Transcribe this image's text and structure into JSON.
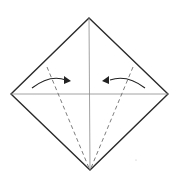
{
  "diagram": {
    "type": "origami-fold-step",
    "description": "Square base in diamond orientation; fold left and right lower edges to the center crease",
    "colors": {
      "outline": "#2a2a2a",
      "crease": "#8a8a8a",
      "fold_line": "#6e6e6e",
      "arrow": "#222222",
      "background": "#ffffff"
    },
    "vertices": {
      "top": [
        89,
        18
      ],
      "left": [
        11,
        94
      ],
      "right": [
        168,
        94
      ],
      "bottom": [
        90,
        170
      ]
    },
    "creases": [
      {
        "name": "vertical-crease",
        "from": [
          89,
          18
        ],
        "to": [
          90,
          170
        ]
      },
      {
        "name": "horizontal-crease",
        "from": [
          11,
          94
        ],
        "to": [
          168,
          94
        ]
      }
    ],
    "valley_fold_lines": [
      {
        "name": "left-valley-fold",
        "from": [
          47,
          67
        ],
        "to": [
          89,
          168
        ]
      },
      {
        "name": "right-valley-fold",
        "from": [
          133,
          67
        ],
        "to": [
          91,
          168
        ]
      }
    ],
    "arrows": [
      {
        "name": "left-fold-arrow",
        "direction": "right",
        "from": [
          32,
          87
        ],
        "to": [
          70,
          80
        ]
      },
      {
        "name": "right-fold-arrow",
        "direction": "left",
        "from": [
          145,
          87
        ],
        "to": [
          102,
          80
        ]
      }
    ]
  }
}
